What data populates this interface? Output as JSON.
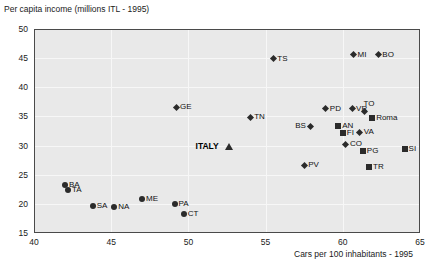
{
  "chart_data": {
    "type": "scatter",
    "title": "",
    "ylabel": "Per capita income (millions ITL - 1995)",
    "xlabel": "Cars per 100 inhabitants - 1995",
    "xlim": [
      40,
      65
    ],
    "ylim": [
      15,
      50
    ],
    "xticks": [
      40,
      45,
      50,
      55,
      60,
      65
    ],
    "yticks": [
      15,
      20,
      25,
      30,
      35,
      40,
      45,
      50
    ],
    "grid": true,
    "legend": "none",
    "plot_bgcolor": "#e9e9e9",
    "marker_color": "#2b2b2b",
    "points": [
      {
        "label": "TS",
        "x": 55.5,
        "y": 44.9,
        "marker": "diamond",
        "label_pos": "right"
      },
      {
        "label": "MI",
        "x": 60.7,
        "y": 45.6,
        "marker": "diamond",
        "label_pos": "right"
      },
      {
        "label": "BO",
        "x": 62.3,
        "y": 45.6,
        "marker": "diamond",
        "label_pos": "right"
      },
      {
        "label": "GE",
        "x": 49.2,
        "y": 36.6,
        "marker": "diamond",
        "label_pos": "right"
      },
      {
        "label": "TN",
        "x": 54.0,
        "y": 34.9,
        "marker": "diamond",
        "label_pos": "right"
      },
      {
        "label": "PD",
        "x": 58.9,
        "y": 36.3,
        "marker": "diamond",
        "label_pos": "right"
      },
      {
        "label": "VR",
        "x": 60.6,
        "y": 36.3,
        "marker": "diamond",
        "label_pos": "right"
      },
      {
        "label": "TO",
        "x": 61.4,
        "y": 35.9,
        "marker": "diamond",
        "label_pos": "above-right"
      },
      {
        "label": "Roma",
        "x": 61.9,
        "y": 34.8,
        "marker": "square",
        "label_pos": "right"
      },
      {
        "label": "BS",
        "x": 57.9,
        "y": 33.3,
        "marker": "diamond",
        "label_pos": "left"
      },
      {
        "label": "AN",
        "x": 59.7,
        "y": 33.4,
        "marker": "square",
        "label_pos": "right"
      },
      {
        "label": "FI",
        "x": 60.0,
        "y": 32.2,
        "marker": "square",
        "label_pos": "right"
      },
      {
        "label": "VA",
        "x": 61.1,
        "y": 32.3,
        "marker": "diamond",
        "label_pos": "right"
      },
      {
        "label": "CO",
        "x": 60.2,
        "y": 30.2,
        "marker": "diamond",
        "label_pos": "right"
      },
      {
        "label": "PG",
        "x": 61.3,
        "y": 29.1,
        "marker": "square",
        "label_pos": "right"
      },
      {
        "label": "SI",
        "x": 64.0,
        "y": 29.4,
        "marker": "square",
        "label_pos": "right"
      },
      {
        "label": "TR",
        "x": 61.7,
        "y": 26.3,
        "marker": "square",
        "label_pos": "right"
      },
      {
        "label": "PV",
        "x": 57.5,
        "y": 26.6,
        "marker": "diamond",
        "label_pos": "right"
      },
      {
        "label": "ITALY",
        "x": 52.6,
        "y": 29.9,
        "marker": "triangle",
        "label_pos": "left"
      },
      {
        "label": "BA",
        "x": 42.0,
        "y": 23.2,
        "marker": "circle",
        "label_pos": "right"
      },
      {
        "label": "TA",
        "x": 42.2,
        "y": 22.3,
        "marker": "circle",
        "label_pos": "right"
      },
      {
        "label": "SA",
        "x": 43.8,
        "y": 19.6,
        "marker": "circle",
        "label_pos": "right"
      },
      {
        "label": "NA",
        "x": 45.2,
        "y": 19.4,
        "marker": "circle",
        "label_pos": "right"
      },
      {
        "label": "ME",
        "x": 47.0,
        "y": 20.9,
        "marker": "circle",
        "label_pos": "right"
      },
      {
        "label": "PA",
        "x": 49.1,
        "y": 19.9,
        "marker": "circle",
        "label_pos": "right"
      },
      {
        "label": "CT",
        "x": 49.7,
        "y": 18.3,
        "marker": "circle",
        "label_pos": "right"
      }
    ]
  }
}
